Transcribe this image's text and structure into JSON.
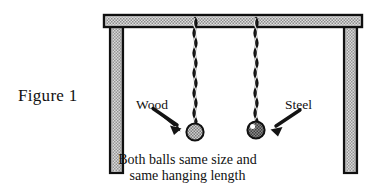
{
  "figure": {
    "label": "Figure 1",
    "caption_line_1": "Both balls same size and",
    "caption_line_2": "same hanging length",
    "annotations": {
      "left_ball": "Wood",
      "right_ball": "Steel"
    },
    "colors": {
      "background": "#ffffff",
      "outline": "#101010",
      "frame_fill_light": "#d8d8d8",
      "frame_fill_mid": "#a8a8a8",
      "wood_ball_fill": "#a9a9a9",
      "steel_ball_fill": "#6e6e6e",
      "steel_ball_highlight": "#ffffff",
      "string": "#2b2b2b",
      "text": "#111111"
    },
    "parts": {
      "beam": "horizontal-beam",
      "left_post": "left-support-post",
      "right_post": "right-support-post",
      "left_string": "wood-ball-string",
      "right_string": "steel-ball-string",
      "left_ball": "wood-ball",
      "right_ball": "steel-ball",
      "left_arrow": "wood-pointer-arrow",
      "right_arrow": "steel-pointer-arrow"
    }
  }
}
